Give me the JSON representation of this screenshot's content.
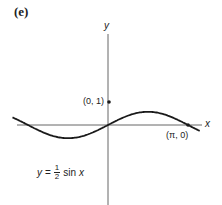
{
  "panel": {
    "label": "(e)"
  },
  "axes": {
    "x_label": "x",
    "y_label": "y"
  },
  "points": [
    {
      "label": "(0, 1)",
      "x": 0,
      "y": 1
    },
    {
      "label": "(π, 0)",
      "x": 3.14159,
      "y": 0
    }
  ],
  "equation": {
    "lhs": "y",
    "eq": "=",
    "num": "1",
    "den": "2",
    "fn": "sin",
    "var": "x"
  },
  "colors": {
    "curve": "#1a1a1a",
    "axis": "#555555",
    "text": "#222222"
  },
  "chart_data": {
    "type": "line",
    "title": "(e)",
    "xlabel": "x",
    "ylabel": "y",
    "function": "y = 1/2 sin x",
    "series": [
      {
        "name": "y = 1/2 sin x",
        "x": [
          -3.8,
          -3.14,
          -2.36,
          -1.57,
          -0.79,
          0,
          0.79,
          1.57,
          2.36,
          3.14,
          3.6
        ],
        "values": [
          0.31,
          0.0,
          -0.35,
          -0.5,
          -0.35,
          0.0,
          0.35,
          0.5,
          0.35,
          0.0,
          -0.22
        ]
      }
    ],
    "annotations": [
      {
        "text": "(0, 1)",
        "x": 0,
        "y": 1
      },
      {
        "text": "(π, 0)",
        "x": 3.14159,
        "y": 0
      }
    ],
    "grid": false,
    "legend": null
  }
}
